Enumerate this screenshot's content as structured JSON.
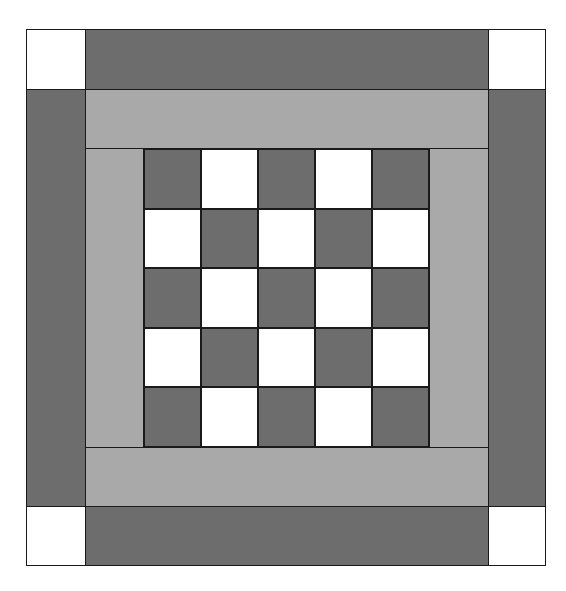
{
  "figure": {
    "title": "",
    "colors": {
      "dark": "#6d6d6d",
      "light": "#a9a9a9",
      "white": "#ffffff",
      "outline": "#1a1a1a"
    },
    "checkerboard": {
      "rows": 5,
      "cols": 5,
      "pattern": [
        [
          "dark",
          "white",
          "dark",
          "white",
          "dark"
        ],
        [
          "white",
          "dark",
          "white",
          "dark",
          "white"
        ],
        [
          "dark",
          "white",
          "dark",
          "white",
          "dark"
        ],
        [
          "white",
          "dark",
          "white",
          "dark",
          "white"
        ],
        [
          "dark",
          "white",
          "dark",
          "white",
          "dark"
        ]
      ]
    }
  }
}
